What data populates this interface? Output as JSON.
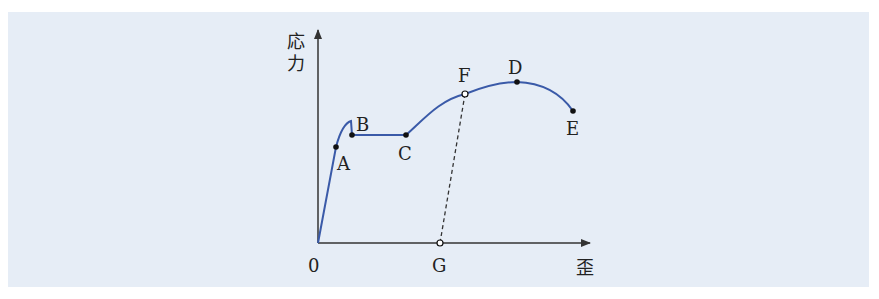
{
  "diagram": {
    "axes": {
      "y_label_line1": "応",
      "y_label_line2": "力",
      "x_label": "歪",
      "origin_label": "0"
    },
    "points": {
      "A": "A",
      "B": "B",
      "C": "C",
      "D": "D",
      "E": "E",
      "F": "F",
      "G": "G"
    },
    "colors": {
      "background": "#e6edf6",
      "curve": "#3a5aa8",
      "axis": "#333333"
    }
  }
}
